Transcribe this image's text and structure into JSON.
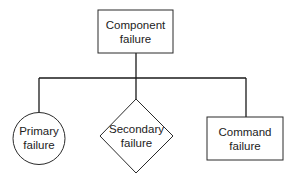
{
  "diagram": {
    "type": "hierarchy",
    "root": {
      "shape": "rectangle",
      "lines": [
        "Component",
        "failure"
      ]
    },
    "children": [
      {
        "shape": "circle",
        "lines": [
          "Primary",
          "failure"
        ]
      },
      {
        "shape": "diamond",
        "lines": [
          "Secondary",
          "failure"
        ]
      },
      {
        "shape": "rectangle",
        "lines": [
          "Command",
          "failure"
        ]
      }
    ]
  },
  "colors": {
    "background": "#ffffff",
    "stroke": "#1a1a1a",
    "text": "#222222"
  }
}
